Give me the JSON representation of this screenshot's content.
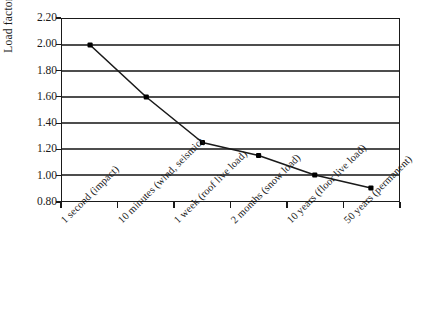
{
  "chart_data": {
    "type": "line",
    "title": "",
    "xlabel": "",
    "ylabel": "Load factor",
    "categories": [
      "1 second (impact)",
      "10 minutes (wind, seismic)",
      "1 week (roof live load)",
      "2 months (snow load)",
      "10 years (floor live load)",
      "50 years (permanent)"
    ],
    "values": [
      2.0,
      1.6,
      1.25,
      1.15,
      1.0,
      0.9
    ],
    "ylim": [
      0.8,
      2.2
    ],
    "ytick_step": 0.2,
    "ytick_labels": [
      "2.20",
      "2.00",
      "1.80",
      "1.60",
      "1.40",
      "1.20",
      "1.00",
      "0.80"
    ],
    "ytick_values": [
      2.2,
      2.0,
      1.8,
      1.6,
      1.4,
      1.2,
      1.0,
      0.8
    ],
    "grid": "horizontal",
    "legend": "none",
    "series_color": "#1a1a1a",
    "marker": "filled-square",
    "marker_color": "#000000",
    "gridline_color": "#4d4d4d",
    "frame_color": "#1a1a1a",
    "background": "#ffffff"
  }
}
